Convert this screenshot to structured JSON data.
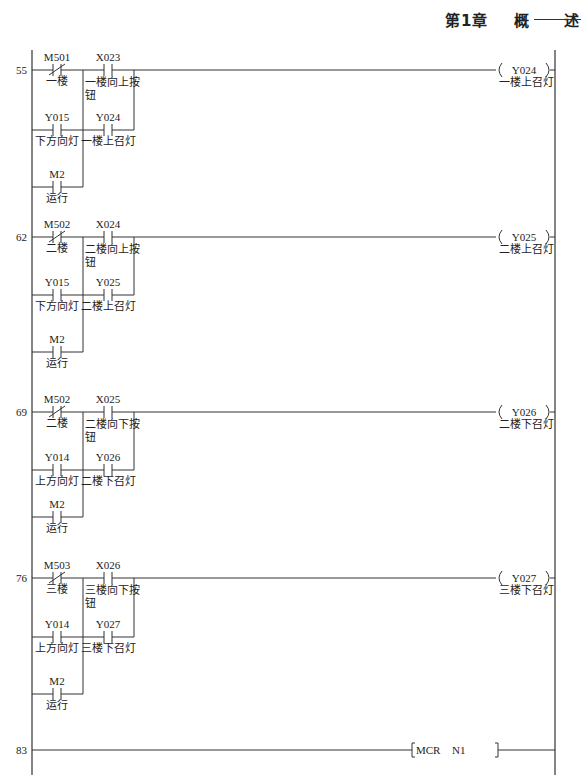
{
  "header": {
    "chapter": "第1章",
    "word1": "概",
    "word2": "述"
  },
  "colors": {
    "line": "#333333",
    "text": "#222222",
    "background": "#ffffff"
  },
  "rungs": [
    {
      "step": "55",
      "contacts": [
        {
          "addr": "M501",
          "comment": "一楼",
          "type": "NC"
        },
        {
          "addr": "X023",
          "comment": "一楼向上按",
          "comment2": "钮",
          "type": "NO"
        },
        {
          "addr": "Y015",
          "comment": "下方向灯",
          "type": "NO"
        },
        {
          "addr": "Y024",
          "comment": "一楼上召灯",
          "type": "NO"
        },
        {
          "addr": "M2",
          "comment": "运行",
          "type": "NO"
        }
      ],
      "coil": {
        "addr": "Y024",
        "comment": "一楼上召灯"
      }
    },
    {
      "step": "62",
      "contacts": [
        {
          "addr": "M502",
          "comment": "二楼",
          "type": "NC"
        },
        {
          "addr": "X024",
          "comment": "二楼向上按",
          "comment2": "钮",
          "type": "NO"
        },
        {
          "addr": "Y015",
          "comment": "下方向灯",
          "type": "NO"
        },
        {
          "addr": "Y025",
          "comment": "二楼上召灯",
          "type": "NO"
        },
        {
          "addr": "M2",
          "comment": "运行",
          "type": "NO"
        }
      ],
      "coil": {
        "addr": "Y025",
        "comment": "二楼上召灯"
      }
    },
    {
      "step": "69",
      "contacts": [
        {
          "addr": "M502",
          "comment": "二楼",
          "type": "NC"
        },
        {
          "addr": "X025",
          "comment": "二楼向下按",
          "comment2": "钮",
          "type": "NO"
        },
        {
          "addr": "Y014",
          "comment": "上方向灯",
          "type": "NO"
        },
        {
          "addr": "Y026",
          "comment": "二楼下召灯",
          "type": "NO"
        },
        {
          "addr": "M2",
          "comment": "运行",
          "type": "NO"
        }
      ],
      "coil": {
        "addr": "Y026",
        "comment": "二楼下召灯"
      }
    },
    {
      "step": "76",
      "contacts": [
        {
          "addr": "M503",
          "comment": "三楼",
          "type": "NC"
        },
        {
          "addr": "X026",
          "comment": "三楼向下按",
          "comment2": "钮",
          "type": "NO"
        },
        {
          "addr": "Y014",
          "comment": "上方向灯",
          "type": "NO"
        },
        {
          "addr": "Y027",
          "comment": "三楼下召灯",
          "type": "NO"
        },
        {
          "addr": "M2",
          "comment": "运行",
          "type": "NO"
        }
      ],
      "coil": {
        "addr": "Y027",
        "comment": "三楼下召灯"
      }
    }
  ],
  "final_rung": {
    "step": "83",
    "instruction": "MCR",
    "operand": "N1"
  }
}
